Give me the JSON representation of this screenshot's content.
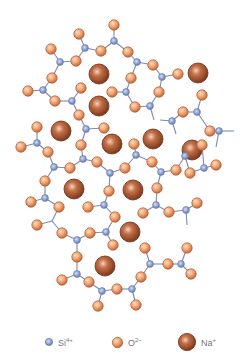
{
  "diagram": {
    "colors": {
      "si": "#8a9fcf",
      "si_stroke": "#6b7fae",
      "o": "#f0a070",
      "o_stroke": "#b8643a",
      "na": "#a4532c",
      "na_stroke": "#6e3015",
      "bond": "#7f8ab0",
      "background": "#ffffff"
    },
    "sizes": {
      "si_r": 3.4,
      "o_r": 5.2,
      "na_r": 10
    },
    "si": [
      [
        114,
        41
      ],
      [
        85,
        48
      ],
      [
        60,
        62
      ],
      [
        137,
        62
      ],
      [
        162,
        77
      ],
      [
        43,
        90
      ],
      [
        72,
        101
      ],
      [
        126,
        92
      ],
      [
        150,
        106
      ],
      [
        172,
        121
      ],
      [
        197,
        112
      ],
      [
        219,
        131
      ],
      [
        86,
        129
      ],
      [
        37,
        143
      ],
      [
        54,
        167
      ],
      [
        83,
        159
      ],
      [
        110,
        173
      ],
      [
        136,
        155
      ],
      [
        161,
        172
      ],
      [
        185,
        156
      ],
      [
        204,
        168
      ],
      [
        45,
        198
      ],
      [
        104,
        205
      ],
      [
        156,
        205
      ],
      [
        186,
        210
      ],
      [
        77,
        240
      ],
      [
        106,
        232
      ],
      [
        150,
        264
      ],
      [
        181,
        264
      ],
      [
        77,
        274
      ],
      [
        102,
        291
      ],
      [
        132,
        289
      ]
    ],
    "o": [
      [
        114,
        25
      ],
      [
        79,
        34
      ],
      [
        51,
        49
      ],
      [
        101,
        51
      ],
      [
        76,
        61
      ],
      [
        128,
        52
      ],
      [
        153,
        65
      ],
      [
        52,
        78
      ],
      [
        28,
        91
      ],
      [
        81,
        88
      ],
      [
        178,
        74
      ],
      [
        131,
        78
      ],
      [
        112,
        92
      ],
      [
        159,
        92
      ],
      [
        135,
        107
      ],
      [
        202,
        95
      ],
      [
        183,
        112
      ],
      [
        210,
        131
      ],
      [
        79,
        115
      ],
      [
        104,
        128
      ],
      [
        55,
        101
      ],
      [
        37,
        127
      ],
      [
        21,
        147
      ],
      [
        48,
        152
      ],
      [
        81,
        145
      ],
      [
        134,
        144
      ],
      [
        202,
        145
      ],
      [
        70,
        168
      ],
      [
        97,
        162
      ],
      [
        125,
        168
      ],
      [
        152,
        162
      ],
      [
        176,
        170
      ],
      [
        45,
        181
      ],
      [
        109,
        191
      ],
      [
        157,
        188
      ],
      [
        190,
        173
      ],
      [
        216,
        165
      ],
      [
        31,
        202
      ],
      [
        59,
        207
      ],
      [
        88,
        207
      ],
      [
        115,
        217
      ],
      [
        143,
        213
      ],
      [
        169,
        212
      ],
      [
        197,
        203
      ],
      [
        37,
        225
      ],
      [
        62,
        233
      ],
      [
        90,
        233
      ],
      [
        113,
        245
      ],
      [
        145,
        248
      ],
      [
        187,
        248
      ],
      [
        77,
        257
      ],
      [
        168,
        264
      ],
      [
        191,
        274
      ],
      [
        62,
        280
      ],
      [
        89,
        282
      ],
      [
        117,
        289
      ],
      [
        141,
        277
      ],
      [
        98,
        306
      ],
      [
        136,
        305
      ]
    ],
    "na": [
      [
        99,
        74
      ],
      [
        198,
        73
      ],
      [
        99,
        106
      ],
      [
        61,
        131
      ],
      [
        153,
        139
      ],
      [
        112,
        144
      ],
      [
        192,
        150
      ],
      [
        74,
        189
      ],
      [
        133,
        190
      ],
      [
        130,
        232
      ],
      [
        105,
        266
      ]
    ],
    "bonds": [
      [
        [
          114,
          41
        ],
        [
          114,
          25
        ]
      ],
      [
        [
          114,
          41
        ],
        [
          101,
          51
        ]
      ],
      [
        [
          114,
          41
        ],
        [
          128,
          52
        ]
      ],
      [
        [
          85,
          48
        ],
        [
          79,
          34
        ]
      ],
      [
        [
          85,
          48
        ],
        [
          101,
          51
        ]
      ],
      [
        [
          85,
          48
        ],
        [
          76,
          61
        ]
      ],
      [
        [
          60,
          62
        ],
        [
          51,
          49
        ]
      ],
      [
        [
          60,
          62
        ],
        [
          76,
          61
        ]
      ],
      [
        [
          60,
          62
        ],
        [
          52,
          78
        ]
      ],
      [
        [
          137,
          62
        ],
        [
          128,
          52
        ]
      ],
      [
        [
          137,
          62
        ],
        [
          153,
          65
        ]
      ],
      [
        [
          137,
          62
        ],
        [
          131,
          78
        ]
      ],
      [
        [
          162,
          77
        ],
        [
          153,
          65
        ]
      ],
      [
        [
          162,
          77
        ],
        [
          178,
          74
        ]
      ],
      [
        [
          162,
          77
        ],
        [
          159,
          92
        ]
      ],
      [
        [
          43,
          90
        ],
        [
          52,
          78
        ]
      ],
      [
        [
          43,
          90
        ],
        [
          28,
          91
        ]
      ],
      [
        [
          43,
          90
        ],
        [
          55,
          101
        ]
      ],
      [
        [
          72,
          101
        ],
        [
          81,
          88
        ]
      ],
      [
        [
          72,
          101
        ],
        [
          55,
          101
        ]
      ],
      [
        [
          72,
          101
        ],
        [
          79,
          115
        ]
      ],
      [
        [
          126,
          92
        ],
        [
          131,
          78
        ]
      ],
      [
        [
          126,
          92
        ],
        [
          112,
          92
        ]
      ],
      [
        [
          126,
          92
        ],
        [
          135,
          107
        ]
      ],
      [
        [
          150,
          106
        ],
        [
          135,
          107
        ]
      ],
      [
        [
          150,
          106
        ],
        [
          159,
          92
        ]
      ],
      [
        [
          150,
          106
        ],
        [
          154,
          120
        ]
      ],
      [
        [
          172,
          121
        ],
        [
          183,
          112
        ]
      ],
      [
        [
          172,
          121
        ],
        [
          160,
          120
        ]
      ],
      [
        [
          172,
          121
        ],
        [
          176,
          134
        ]
      ],
      [
        [
          197,
          112
        ],
        [
          202,
          95
        ]
      ],
      [
        [
          197,
          112
        ],
        [
          183,
          112
        ]
      ],
      [
        [
          197,
          112
        ],
        [
          210,
          131
        ]
      ],
      [
        [
          219,
          131
        ],
        [
          210,
          131
        ]
      ],
      [
        [
          219,
          131
        ],
        [
          234,
          131
        ]
      ],
      [
        [
          219,
          131
        ],
        [
          216,
          147
        ]
      ],
      [
        [
          86,
          129
        ],
        [
          79,
          115
        ]
      ],
      [
        [
          86,
          129
        ],
        [
          104,
          128
        ]
      ],
      [
        [
          86,
          129
        ],
        [
          81,
          145
        ]
      ],
      [
        [
          37,
          143
        ],
        [
          37,
          127
        ]
      ],
      [
        [
          37,
          143
        ],
        [
          21,
          147
        ]
      ],
      [
        [
          37,
          143
        ],
        [
          48,
          152
        ]
      ],
      [
        [
          54,
          167
        ],
        [
          48,
          152
        ]
      ],
      [
        [
          54,
          167
        ],
        [
          70,
          168
        ]
      ],
      [
        [
          54,
          167
        ],
        [
          45,
          181
        ]
      ],
      [
        [
          83,
          159
        ],
        [
          81,
          145
        ]
      ],
      [
        [
          83,
          159
        ],
        [
          70,
          168
        ]
      ],
      [
        [
          83,
          159
        ],
        [
          97,
          162
        ]
      ],
      [
        [
          110,
          173
        ],
        [
          97,
          162
        ]
      ],
      [
        [
          110,
          173
        ],
        [
          125,
          168
        ]
      ],
      [
        [
          110,
          173
        ],
        [
          109,
          191
        ]
      ],
      [
        [
          136,
          155
        ],
        [
          134,
          144
        ]
      ],
      [
        [
          136,
          155
        ],
        [
          125,
          168
        ]
      ],
      [
        [
          136,
          155
        ],
        [
          152,
          162
        ]
      ],
      [
        [
          161,
          172
        ],
        [
          152,
          162
        ]
      ],
      [
        [
          161,
          172
        ],
        [
          176,
          170
        ]
      ],
      [
        [
          161,
          172
        ],
        [
          157,
          188
        ]
      ],
      [
        [
          185,
          156
        ],
        [
          176,
          170
        ]
      ],
      [
        [
          185,
          156
        ],
        [
          202,
          145
        ]
      ],
      [
        [
          185,
          156
        ],
        [
          190,
          173
        ]
      ],
      [
        [
          204,
          168
        ],
        [
          190,
          173
        ]
      ],
      [
        [
          204,
          168
        ],
        [
          216,
          165
        ]
      ],
      [
        [
          204,
          168
        ],
        [
          202,
          145
        ]
      ],
      [
        [
          45,
          198
        ],
        [
          45,
          181
        ]
      ],
      [
        [
          45,
          198
        ],
        [
          31,
          202
        ]
      ],
      [
        [
          45,
          198
        ],
        [
          59,
          207
        ]
      ],
      [
        [
          104,
          205
        ],
        [
          109,
          191
        ]
      ],
      [
        [
          104,
          205
        ],
        [
          88,
          207
        ]
      ],
      [
        [
          104,
          205
        ],
        [
          115,
          217
        ]
      ],
      [
        [
          156,
          205
        ],
        [
          157,
          188
        ]
      ],
      [
        [
          156,
          205
        ],
        [
          143,
          213
        ]
      ],
      [
        [
          156,
          205
        ],
        [
          169,
          212
        ]
      ],
      [
        [
          186,
          210
        ],
        [
          169,
          212
        ]
      ],
      [
        [
          186,
          210
        ],
        [
          197,
          203
        ]
      ],
      [
        [
          186,
          210
        ],
        [
          187,
          225
        ]
      ],
      [
        [
          77,
          240
        ],
        [
          62,
          233
        ]
      ],
      [
        [
          77,
          240
        ],
        [
          90,
          233
        ]
      ],
      [
        [
          77,
          240
        ],
        [
          77,
          257
        ]
      ],
      [
        [
          106,
          232
        ],
        [
          90,
          233
        ]
      ],
      [
        [
          106,
          232
        ],
        [
          113,
          245
        ]
      ],
      [
        [
          106,
          232
        ],
        [
          115,
          217
        ]
      ],
      [
        [
          150,
          264
        ],
        [
          145,
          248
        ]
      ],
      [
        [
          150,
          264
        ],
        [
          168,
          264
        ]
      ],
      [
        [
          150,
          264
        ],
        [
          141,
          277
        ]
      ],
      [
        [
          181,
          264
        ],
        [
          168,
          264
        ]
      ],
      [
        [
          181,
          264
        ],
        [
          187,
          248
        ]
      ],
      [
        [
          181,
          264
        ],
        [
          191,
          274
        ]
      ],
      [
        [
          77,
          274
        ],
        [
          77,
          257
        ]
      ],
      [
        [
          77,
          274
        ],
        [
          62,
          280
        ]
      ],
      [
        [
          77,
          274
        ],
        [
          89,
          282
        ]
      ],
      [
        [
          102,
          291
        ],
        [
          89,
          282
        ]
      ],
      [
        [
          102,
          291
        ],
        [
          117,
          289
        ]
      ],
      [
        [
          102,
          291
        ],
        [
          98,
          306
        ]
      ],
      [
        [
          132,
          289
        ],
        [
          117,
          289
        ]
      ],
      [
        [
          132,
          289
        ],
        [
          141,
          277
        ]
      ],
      [
        [
          132,
          289
        ],
        [
          136,
          305
        ]
      ],
      [
        [
          52,
          221
        ],
        [
          37,
          225
        ]
      ],
      [
        [
          52,
          221
        ],
        [
          62,
          233
        ]
      ],
      [
        [
          52,
          221
        ],
        [
          59,
          207
        ]
      ]
    ]
  },
  "legend": {
    "items": [
      {
        "key": "si",
        "label": "Si",
        "charge": "4+"
      },
      {
        "key": "o",
        "label": "O",
        "charge": "2−"
      },
      {
        "key": "na",
        "label": "Na",
        "charge": "+"
      }
    ]
  }
}
